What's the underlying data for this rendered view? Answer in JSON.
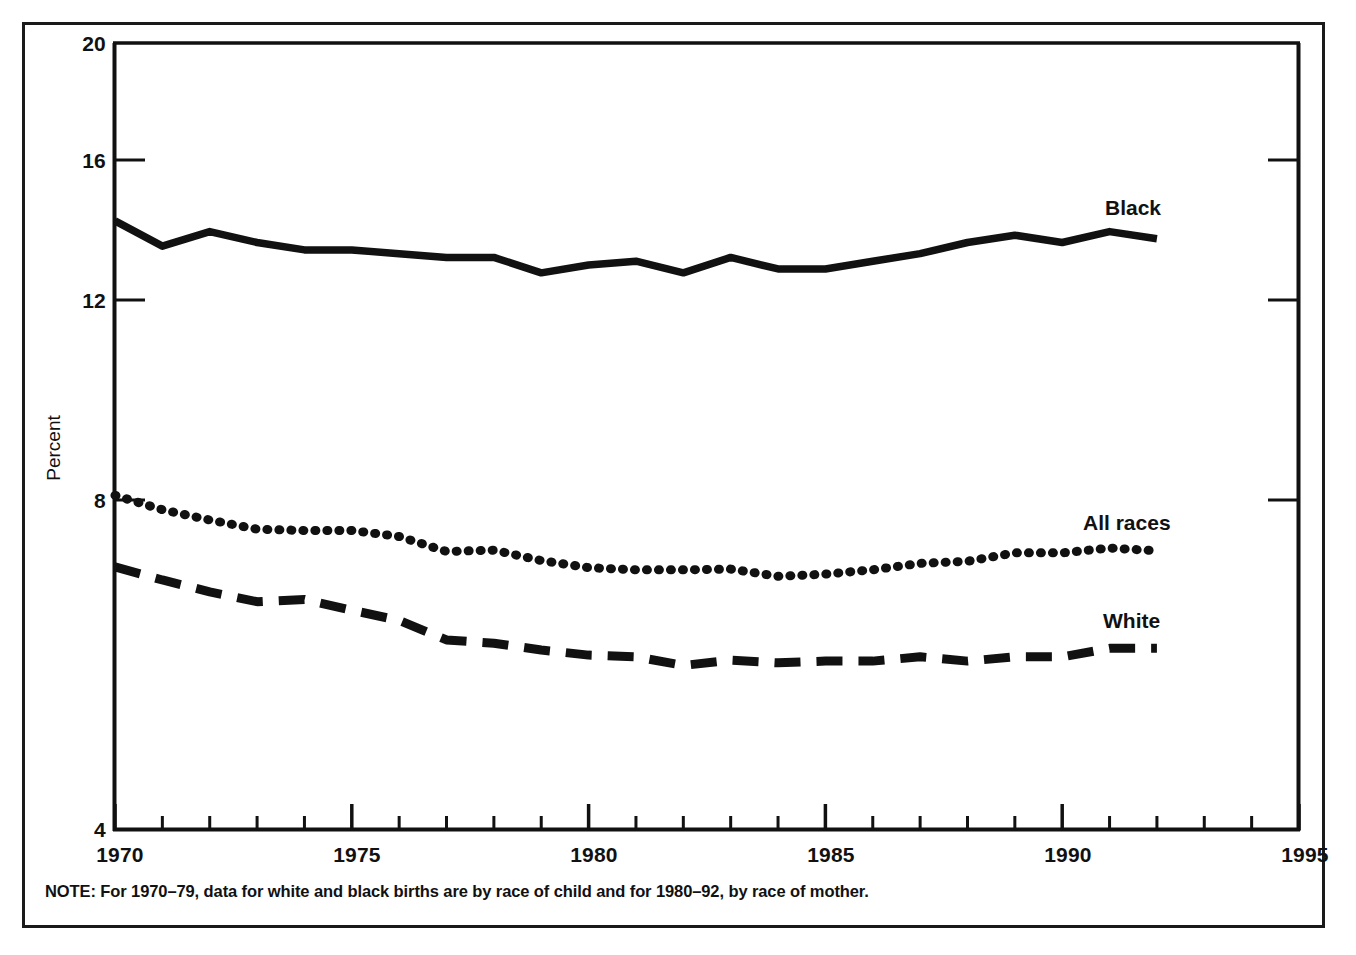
{
  "figure": {
    "note": "NOTE: For 1970–79, data for white and black births are by race of child and for 1980–92, by race of mother."
  },
  "axes": {
    "y_title": "Percent",
    "y_ticks": [
      "4",
      "8",
      "12",
      "16",
      "20"
    ],
    "x_ticks": [
      "1970",
      "1975",
      "1980",
      "1985",
      "1990",
      "1995"
    ]
  },
  "series_labels": {
    "black": "Black",
    "all_races": "All races",
    "white": "White"
  },
  "chart_data": {
    "type": "line",
    "title": "",
    "subtitle": "",
    "xlabel": "",
    "ylabel": "Percent",
    "xlim": [
      1970,
      1995
    ],
    "ylim": [
      4,
      20
    ],
    "yscale": "log",
    "grid": false,
    "legend": "inline-right-labels",
    "note": "NOTE: For 1970–79, data for white and black births are by race of child and for 1980–92, by race of mother.",
    "x": [
      1970,
      1971,
      1972,
      1973,
      1974,
      1975,
      1976,
      1977,
      1978,
      1979,
      1980,
      1981,
      1982,
      1983,
      1984,
      1985,
      1986,
      1987,
      1988,
      1989,
      1990,
      1991,
      1992
    ],
    "series": [
      {
        "name": "Black",
        "linestyle": "solid",
        "color": "#111111",
        "values": [
          13.9,
          13.2,
          13.6,
          13.3,
          13.1,
          13.1,
          13.0,
          12.9,
          12.9,
          12.5,
          12.7,
          12.8,
          12.5,
          12.9,
          12.6,
          12.6,
          12.8,
          13.0,
          13.3,
          13.5,
          13.3,
          13.6,
          13.4
        ]
      },
      {
        "name": "All races",
        "linestyle": "dotted",
        "color": "#111111",
        "values": [
          7.93,
          7.7,
          7.54,
          7.4,
          7.38,
          7.38,
          7.29,
          7.07,
          7.09,
          6.94,
          6.84,
          6.81,
          6.81,
          6.82,
          6.72,
          6.75,
          6.81,
          6.9,
          6.93,
          7.05,
          7.05,
          7.12,
          7.08
        ]
      },
      {
        "name": "White",
        "linestyle": "dashed",
        "color": "#111111",
        "values": [
          6.85,
          6.67,
          6.51,
          6.38,
          6.41,
          6.27,
          6.14,
          5.9,
          5.86,
          5.78,
          5.72,
          5.7,
          5.6,
          5.66,
          5.63,
          5.65,
          5.65,
          5.7,
          5.65,
          5.7,
          5.7,
          5.8,
          5.8
        ]
      }
    ]
  }
}
